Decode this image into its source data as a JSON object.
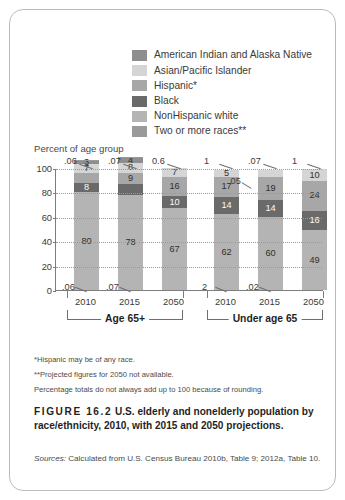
{
  "figure": {
    "number": "FIGURE 16.2",
    "caption": "U.S. elderly and nonelderly population by race/ethnicity, 2010, with 2015 and 2050 projections.",
    "sources_label": "Sources:",
    "sources_text": "Calculated from U.S. Census Bureau 2010b, Table 9; 2012a, Table 10."
  },
  "notes": [
    "*Hispanic may be of any race.",
    "**Projected figures for 2050 not available.",
    "Percentage totals do not always add up to 100 because of rounding."
  ],
  "legend": {
    "items": [
      {
        "label": "American Indian and Alaska Native",
        "color": "#8e8e8e"
      },
      {
        "label": "Asian/Pacific Islander",
        "color": "#d5d5d5"
      },
      {
        "label": "Hispanic*",
        "color": "#a7a7a7"
      },
      {
        "label": "Black",
        "color": "#6a6a6a"
      },
      {
        "label": "NonHispanic white",
        "color": "#b4b4b4"
      },
      {
        "label": "Two or more races**",
        "color": "#9a9a9a"
      }
    ]
  },
  "chart_data": {
    "type": "bar",
    "subtype": "stacked-bar",
    "title": "U.S. elderly and nonelderly population by race/ethnicity, 2010, with 2015 and 2050 projections.",
    "ylabel": "Percent of age group",
    "xlabel": "",
    "ylim": [
      0,
      100
    ],
    "yticks": [
      0,
      20,
      40,
      60,
      80,
      100
    ],
    "grid": true,
    "legend_position": "top",
    "series": [
      {
        "name": "Two or more races**",
        "color": "#9a9a9a"
      },
      {
        "name": "Asian/Pacific Islander",
        "color": "#d5d5d5"
      },
      {
        "name": "Hispanic*",
        "color": "#a7a7a7"
      },
      {
        "name": "Black",
        "color": "#6a6a6a"
      },
      {
        "name": "NonHispanic white",
        "color": "#b4b4b4"
      },
      {
        "name": "American Indian and Alaska Native",
        "color": "#8e8e8e"
      }
    ],
    "groups": [
      {
        "label": "Age 65+",
        "categories": [
          "2010",
          "2015",
          "2050"
        ],
        "bars": [
          {
            "category": "2010",
            "top_callout": ".06",
            "bottom_callout": ".06",
            "segments": [
              {
                "name": "Two or more races**",
                "value": 0.6,
                "label": "",
                "color": "#9a9a9a",
                "shown": false
              },
              {
                "name": "American Indian and Alaska Native",
                "value": 3,
                "label": "3",
                "color": "#8e8e8e",
                "shown": true
              },
              {
                "name": "Asian/Pacific Islander",
                "value": 7,
                "label": "7",
                "color": "#d5d5d5",
                "shown": true
              },
              {
                "name": "Hispanic*",
                "value": 8,
                "label": "",
                "color": "#a7a7a7",
                "shown": false
              },
              {
                "name": "Black",
                "value": 8,
                "label": "8",
                "color": "#6a6a6a",
                "shown": true
              },
              {
                "name": "NonHispanic white",
                "value": 80,
                "label": "80",
                "color": "#b4b4b4",
                "shown": true
              }
            ]
          },
          {
            "category": "2015",
            "top_callout": ".07",
            "bottom_callout": ".07",
            "segments": [
              {
                "name": "Two or more races**",
                "value": 0.7,
                "label": "",
                "color": "#9a9a9a",
                "shown": false
              },
              {
                "name": "American Indian and Alaska Native",
                "value": 4,
                "label": "4",
                "color": "#8e8e8e",
                "shown": true
              },
              {
                "name": "Asian/Pacific Islander",
                "value": 8,
                "label": "8",
                "color": "#d5d5d5",
                "shown": true
              },
              {
                "name": "Hispanic*",
                "value": 9,
                "label": "9",
                "color": "#a7a7a7",
                "shown": true
              },
              {
                "name": "Black",
                "value": 9,
                "label": "",
                "color": "#6a6a6a",
                "shown": false
              },
              {
                "name": "NonHispanic white",
                "value": 78,
                "label": "78",
                "color": "#b4b4b4",
                "shown": true
              }
            ]
          },
          {
            "category": "2050",
            "top_callout": "0.6",
            "bottom_callout": "",
            "segments": [
              {
                "name": "Asian/Pacific Islander",
                "value": 7,
                "label": "7",
                "color": "#d5d5d5",
                "shown": true
              },
              {
                "name": "Hispanic*",
                "value": 16,
                "label": "16",
                "color": "#a7a7a7",
                "shown": true
              },
              {
                "name": "Black",
                "value": 10,
                "label": "10",
                "color": "#6a6a6a",
                "shown": true
              },
              {
                "name": "NonHispanic white",
                "value": 67,
                "label": "67",
                "color": "#b4b4b4",
                "shown": true
              }
            ]
          }
        ]
      },
      {
        "label": "Under age 65",
        "categories": [
          "2010",
          "2015",
          "2050"
        ],
        "bars": [
          {
            "category": "2010",
            "top_callout": "1",
            "bottom_callout": "2",
            "segments": [
              {
                "name": "Asian/Pacific Islander",
                "value": 5,
                "label": "5",
                "color": "#d5d5d5",
                "shown": true
              },
              {
                "name": "Hispanic*",
                "value": 17,
                "label": "17",
                "color": "#a7a7a7",
                "shown": true
              },
              {
                "name": "Black",
                "value": 14,
                "label": "14",
                "color": "#6a6a6a",
                "shown": true
              },
              {
                "name": "NonHispanic white",
                "value": 62,
                "label": "62",
                "color": "#b4b4b4",
                "shown": true
              }
            ]
          },
          {
            "category": "2015",
            "top_callout": ".07",
            "bottom_callout": ".02",
            "segments": [
              {
                "name": "Asian/Pacific Islander",
                "value": 5,
                "label": ".05",
                "color": "#d5d5d5",
                "shown": false
              },
              {
                "name": "Hispanic*",
                "value": 19,
                "label": "19",
                "color": "#a7a7a7",
                "shown": true
              },
              {
                "name": "Black",
                "value": 14,
                "label": "14",
                "color": "#6a6a6a",
                "shown": true
              },
              {
                "name": "NonHispanic white",
                "value": 60,
                "label": "60",
                "color": "#b4b4b4",
                "shown": true
              }
            ]
          },
          {
            "category": "2050",
            "top_callout": "1",
            "bottom_callout": "",
            "segments": [
              {
                "name": "Asian/Pacific Islander",
                "value": 10,
                "label": "10",
                "color": "#d5d5d5",
                "shown": true
              },
              {
                "name": "Hispanic*",
                "value": 24,
                "label": "24",
                "color": "#a7a7a7",
                "shown": true
              },
              {
                "name": "Black",
                "value": 16,
                "label": "16",
                "color": "#6a6a6a",
                "shown": true
              },
              {
                "name": "NonHispanic white",
                "value": 49,
                "label": "49",
                "color": "#b4b4b4",
                "shown": true
              }
            ]
          }
        ]
      }
    ],
    "extra_callouts": {
      "left_2015_inline": ".05",
      "right_2015_inline": ".05"
    }
  }
}
